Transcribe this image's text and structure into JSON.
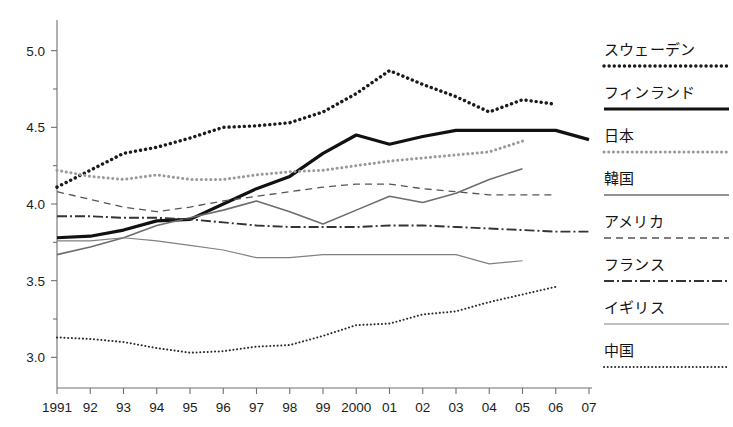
{
  "chart_data": {
    "type": "line",
    "title": "",
    "xlabel": "",
    "ylabel": "",
    "x": [
      1991,
      1992,
      1993,
      1994,
      1995,
      1996,
      1997,
      1998,
      1999,
      2000,
      2001,
      2002,
      2003,
      2004,
      2005,
      2006,
      2007
    ],
    "xtick_labels": [
      "1991",
      "92",
      "93",
      "94",
      "95",
      "96",
      "97",
      "98",
      "99",
      "2000",
      "01",
      "02",
      "03",
      "04",
      "05",
      "06",
      "07"
    ],
    "ytick_labels": [
      "5.0",
      "4.5",
      "4.0",
      "3.5",
      "3.0"
    ],
    "ytick_values": [
      5.0,
      4.5,
      4.0,
      3.5,
      3.0
    ],
    "yminor_values": [
      4.75,
      4.25,
      3.75,
      3.25
    ],
    "ylim": [
      2.8,
      5.2
    ],
    "xlim": [
      1991,
      2007
    ],
    "grid": false,
    "legend_position": "right",
    "series": [
      {
        "name": "スウェーデン",
        "style": "dotted-bold",
        "color": "#1a1a1a",
        "values": [
          4.11,
          4.22,
          4.33,
          4.37,
          4.43,
          4.5,
          4.51,
          4.53,
          4.6,
          4.72,
          4.87,
          4.78,
          4.7,
          4.6,
          4.68,
          4.65,
          null
        ]
      },
      {
        "name": "フィンランド",
        "style": "solid-bold",
        "color": "#111111",
        "values": [
          3.78,
          3.79,
          3.83,
          3.89,
          3.9,
          4.0,
          4.1,
          4.18,
          4.33,
          4.45,
          4.39,
          4.44,
          4.48,
          4.48,
          4.48,
          4.48,
          4.42
        ]
      },
      {
        "name": "日本",
        "style": "dotted-light",
        "color": "#9a9a9a",
        "values": [
          4.22,
          4.18,
          4.16,
          4.19,
          4.16,
          4.16,
          4.19,
          4.21,
          4.22,
          4.25,
          4.28,
          4.3,
          4.32,
          4.34,
          4.41,
          null,
          null
        ]
      },
      {
        "name": "韓国",
        "style": "solid-medium",
        "color": "#6d6d6d",
        "values": [
          3.67,
          3.72,
          3.78,
          3.86,
          3.91,
          3.96,
          4.02,
          3.95,
          3.87,
          3.96,
          4.05,
          4.01,
          4.07,
          4.16,
          4.23,
          null,
          null
        ]
      },
      {
        "name": "アメリカ",
        "style": "dashed",
        "color": "#555555",
        "values": [
          4.08,
          4.03,
          3.98,
          3.95,
          3.98,
          4.02,
          4.05,
          4.08,
          4.11,
          4.13,
          4.13,
          4.1,
          4.08,
          4.06,
          4.06,
          4.06,
          null
        ]
      },
      {
        "name": "フランス",
        "style": "dash-dot",
        "color": "#333333",
        "values": [
          3.92,
          3.92,
          3.91,
          3.91,
          3.9,
          3.88,
          3.86,
          3.85,
          3.85,
          3.85,
          3.86,
          3.86,
          3.85,
          3.84,
          3.83,
          3.82,
          3.82
        ]
      },
      {
        "name": "イギリス",
        "style": "thin-solid",
        "color": "#808080",
        "values": [
          3.76,
          3.76,
          3.78,
          3.76,
          3.73,
          3.7,
          3.65,
          3.65,
          3.67,
          3.67,
          3.67,
          3.67,
          3.67,
          3.61,
          3.63,
          null,
          null
        ]
      },
      {
        "name": "中国",
        "style": "dotted-fine",
        "color": "#2b2b2b",
        "values": [
          3.13,
          3.12,
          3.1,
          3.06,
          3.03,
          3.04,
          3.07,
          3.08,
          3.14,
          3.21,
          3.22,
          3.28,
          3.3,
          3.36,
          3.41,
          3.46,
          null
        ]
      }
    ]
  },
  "legend": {
    "items": [
      {
        "label": "スウェーデン",
        "style": "dotted-bold"
      },
      {
        "label": "フィンランド",
        "style": "solid-bold"
      },
      {
        "label": "日本",
        "style": "dotted-light"
      },
      {
        "label": "韓国",
        "style": "solid-medium"
      },
      {
        "label": "アメリカ",
        "style": "dashed"
      },
      {
        "label": "フランス",
        "style": "dash-dot"
      },
      {
        "label": "イギリス",
        "style": "thin-solid"
      },
      {
        "label": "中国",
        "style": "dotted-fine"
      }
    ]
  }
}
